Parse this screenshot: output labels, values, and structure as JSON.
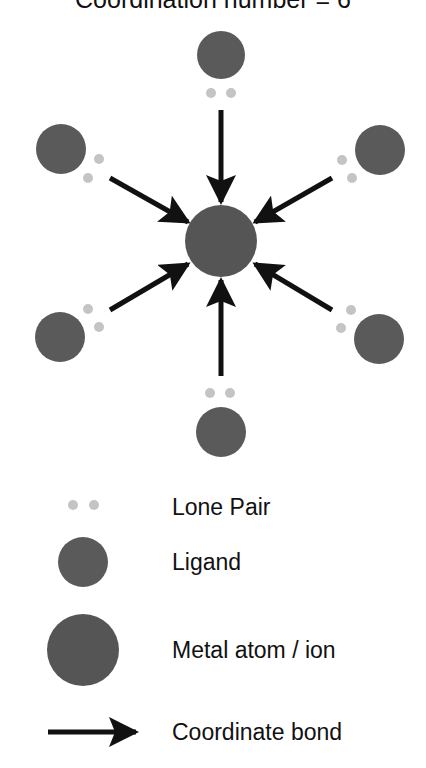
{
  "title": "Coordination number = 6",
  "colors": {
    "ligand": "#5a5a5a",
    "metal": "#555555",
    "lone_pair": "#c4c4c4",
    "bond": "#111111",
    "text": "#111111",
    "background": "#ffffff"
  },
  "diagram": {
    "metal": {
      "label": "Metal atom / ion",
      "cx": 221,
      "cy": 241,
      "r": 36
    },
    "ligands": [
      {
        "position": "top",
        "cx": 221,
        "cy": 55,
        "r": 24,
        "lone_pair": [
          {
            "cx": 211,
            "cy": 93
          },
          {
            "cx": 231,
            "cy": 93
          }
        ],
        "bond": {
          "x1": 221,
          "y1": 110,
          "x2": 221,
          "y2": 202
        }
      },
      {
        "position": "upper-left",
        "cx": 61,
        "cy": 149,
        "r": 25,
        "lone_pair": [
          {
            "cx": 99,
            "cy": 159
          },
          {
            "cx": 88,
            "cy": 178
          }
        ],
        "bond": {
          "x1": 110,
          "y1": 178,
          "x2": 188,
          "y2": 222
        }
      },
      {
        "position": "upper-right",
        "cx": 380,
        "cy": 150,
        "r": 25,
        "lone_pair": [
          {
            "cx": 342,
            "cy": 160
          },
          {
            "cx": 352,
            "cy": 178
          }
        ],
        "bond": {
          "x1": 332,
          "y1": 178,
          "x2": 255,
          "y2": 222
        }
      },
      {
        "position": "lower-left",
        "cx": 60,
        "cy": 337,
        "r": 25,
        "lone_pair": [
          {
            "cx": 88,
            "cy": 309
          },
          {
            "cx": 99,
            "cy": 327
          }
        ],
        "bond": {
          "x1": 110,
          "y1": 310,
          "x2": 188,
          "y2": 264
        }
      },
      {
        "position": "lower-right",
        "cx": 379,
        "cy": 339,
        "r": 25,
        "lone_pair": [
          {
            "cx": 351,
            "cy": 310
          },
          {
            "cx": 341,
            "cy": 328
          }
        ],
        "bond": {
          "x1": 332,
          "y1": 310,
          "x2": 255,
          "y2": 264
        }
      },
      {
        "position": "bottom",
        "cx": 221,
        "cy": 432,
        "r": 25,
        "lone_pair": [
          {
            "cx": 210,
            "cy": 393
          },
          {
            "cx": 230,
            "cy": 393
          }
        ],
        "bond": {
          "x1": 221,
          "y1": 376,
          "x2": 221,
          "y2": 280
        }
      }
    ],
    "lone_pair_radius": 5
  },
  "legend": {
    "items": [
      {
        "key": "lone_pair",
        "label": "Lone Pair"
      },
      {
        "key": "ligand",
        "label": "Ligand"
      },
      {
        "key": "metal",
        "label": "Metal atom / ion"
      },
      {
        "key": "bond",
        "label": "Coordinate bond"
      }
    ]
  }
}
